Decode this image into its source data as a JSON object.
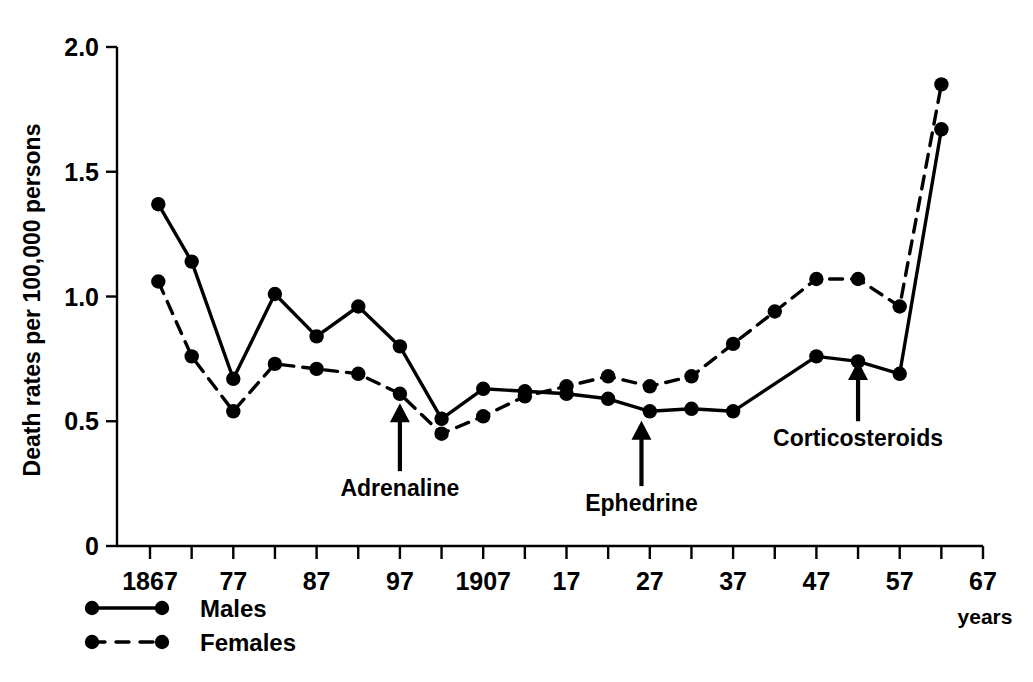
{
  "chart_data": {
    "type": "line",
    "title": "",
    "xlabel": "years",
    "ylabel": "Death rates per 100,000 persons",
    "xlim": [
      1865,
      1967
    ],
    "ylim": [
      0,
      2.0
    ],
    "grid": false,
    "legend_position": "bottom-left",
    "x_tick_labels": [
      "1867",
      "77",
      "87",
      "97",
      "1907",
      "17",
      "27",
      "37",
      "47",
      "57",
      "67"
    ],
    "x_tick_values": [
      1867,
      1877,
      1887,
      1897,
      1907,
      1917,
      1927,
      1937,
      1947,
      1957,
      1967
    ],
    "x_minor_tick_values": [
      1872,
      1882,
      1892,
      1902,
      1912,
      1922,
      1932,
      1942,
      1952,
      1962
    ],
    "y_tick_labels": [
      "0",
      "0.5",
      "1.0",
      "1.5",
      "2.0"
    ],
    "y_tick_values": [
      0,
      0.5,
      1.0,
      1.5,
      2.0
    ],
    "series": [
      {
        "name": "Males",
        "style": "solid",
        "color": "#000000",
        "x": [
          1868,
          1872,
          1877,
          1882,
          1887,
          1892,
          1897,
          1902,
          1907,
          1912,
          1917,
          1922,
          1927,
          1932,
          1937,
          1947,
          1952,
          1957,
          1962
        ],
        "values": [
          1.37,
          1.14,
          0.67,
          1.01,
          0.84,
          0.96,
          0.8,
          0.51,
          0.63,
          0.62,
          0.61,
          0.59,
          0.54,
          0.55,
          0.54,
          0.76,
          0.74,
          0.69,
          1.67
        ]
      },
      {
        "name": "Females",
        "style": "dashed",
        "color": "#000000",
        "x": [
          1868,
          1872,
          1877,
          1882,
          1887,
          1892,
          1897,
          1902,
          1907,
          1912,
          1917,
          1922,
          1927,
          1932,
          1937,
          1942,
          1947,
          1952,
          1957,
          1962
        ],
        "values": [
          1.06,
          0.76,
          0.54,
          0.73,
          0.71,
          0.69,
          0.61,
          0.45,
          0.52,
          0.6,
          0.64,
          0.68,
          0.64,
          0.68,
          0.81,
          0.94,
          1.07,
          1.07,
          0.96,
          1.85
        ]
      }
    ],
    "annotations": [
      {
        "label": "Adrenaline",
        "x": 1897,
        "arrow_tip_y": 0.62,
        "arrow_base_y": 0.3
      },
      {
        "label": "Ephedrine",
        "x": 1926,
        "arrow_tip_y": 0.55,
        "arrow_base_y": 0.24
      },
      {
        "label": "Corticosteroids",
        "x": 1952,
        "arrow_tip_y": 0.79,
        "arrow_base_y": 0.5
      }
    ],
    "legend_entries": [
      {
        "label": "Males",
        "style": "solid"
      },
      {
        "label": "Females",
        "style": "dashed"
      }
    ]
  },
  "axis": {
    "y_title": "Death rates per 100,000 persons",
    "x_units": "years"
  },
  "legend": {
    "males_label": "Males",
    "females_label": "Females"
  },
  "annotations": {
    "adrenaline": "Adrenaline",
    "ephedrine": "Ephedrine",
    "corticosteroids": "Corticosteroids"
  },
  "colors": {
    "ink": "#000000",
    "background": "#ffffff"
  }
}
